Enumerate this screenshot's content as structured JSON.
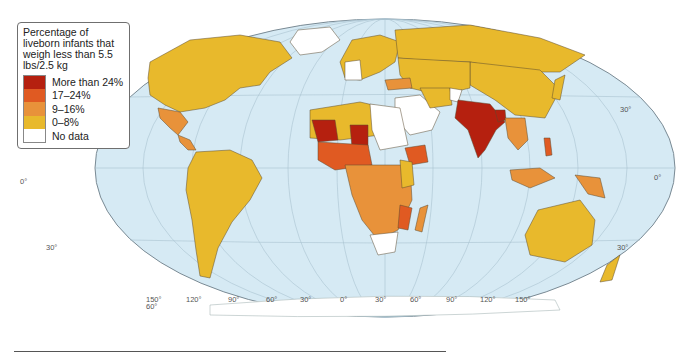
{
  "legend": {
    "title": "Percentage of liveborn infants that weigh less than 5.5 lbs/2.5 kg",
    "items": [
      {
        "label": "More than 24%",
        "color": "#b5200f"
      },
      {
        "label": "17–24%",
        "color": "#e05a22"
      },
      {
        "label": "9–16%",
        "color": "#e8923a"
      },
      {
        "label": "0–8%",
        "color": "#e8b92c"
      },
      {
        "label": "No data",
        "color": "#ffffff"
      }
    ]
  },
  "map": {
    "ocean_color": "#d6eaf4",
    "latitude_labels": {
      "left_equator": "0°",
      "left_30s": "30°",
      "right_30n": "30°",
      "right_equator": "0°",
      "right_30s": "30°",
      "bottom_60s": "60°"
    },
    "longitude_labels": [
      "150°",
      "120°",
      "90°",
      "60°",
      "30°",
      "0°",
      "30°",
      "60°",
      "90°",
      "120°",
      "150°"
    ]
  }
}
